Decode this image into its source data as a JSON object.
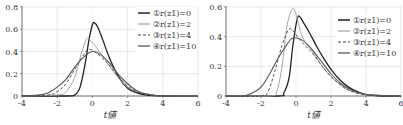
{
  "chart_data": [
    {
      "type": "line",
      "title": "",
      "xlabel": "t値",
      "ylabel": "",
      "xlim": [
        -4,
        6
      ],
      "ylim": [
        0,
        0.8
      ],
      "xticks": [
        "-4",
        "-2",
        "0",
        "2",
        "4",
        "6"
      ],
      "yticks": [
        "0",
        "0.2",
        "0.4",
        "0.6",
        "0.8"
      ],
      "grid": true,
      "legend_position": "upper right",
      "series": [
        {
          "name": "①r(z1)=0",
          "style": "solid-dark",
          "x": [
            -4,
            -1.5,
            -1,
            -0.7,
            -0.4,
            -0.2,
            0,
            0.1,
            0.3,
            0.6,
            1,
            1.5,
            2,
            2.5,
            3,
            4,
            6
          ],
          "values": [
            0,
            0,
            0.01,
            0.08,
            0.3,
            0.5,
            0.64,
            0.66,
            0.62,
            0.5,
            0.33,
            0.17,
            0.07,
            0.03,
            0.01,
            0,
            0
          ]
        },
        {
          "name": "②r(z1)=2",
          "style": "solid-light",
          "x": [
            -4,
            -2,
            -1.5,
            -1,
            -0.6,
            -0.3,
            -0.1,
            0.3,
            0.7,
            1,
            1.5,
            2,
            2.5,
            3,
            4,
            6
          ],
          "values": [
            0,
            0.01,
            0.04,
            0.17,
            0.4,
            0.52,
            0.5,
            0.42,
            0.33,
            0.26,
            0.16,
            0.08,
            0.04,
            0.02,
            0,
            0
          ]
        },
        {
          "name": "③r(z1)=4",
          "style": "dashed",
          "x": [
            -4,
            -2.5,
            -2,
            -1.5,
            -1,
            -0.5,
            -0.2,
            0.2,
            0.7,
            1,
            1.5,
            2,
            2.5,
            3,
            4,
            6
          ],
          "values": [
            0,
            0.01,
            0.04,
            0.11,
            0.24,
            0.37,
            0.42,
            0.39,
            0.32,
            0.27,
            0.17,
            0.09,
            0.04,
            0.02,
            0,
            0
          ]
        },
        {
          "name": "④r(z1)=10",
          "style": "solid-gray",
          "x": [
            -4,
            -3,
            -2.5,
            -2,
            -1.5,
            -1,
            -0.5,
            0,
            0.5,
            1,
            1.5,
            2,
            2.5,
            3,
            4,
            6
          ],
          "values": [
            0,
            0.01,
            0.03,
            0.08,
            0.15,
            0.26,
            0.35,
            0.4,
            0.37,
            0.29,
            0.19,
            0.11,
            0.05,
            0.02,
            0,
            0
          ]
        }
      ]
    },
    {
      "type": "line",
      "title": "",
      "xlabel": "t値",
      "ylabel": "",
      "xlim": [
        -4,
        6
      ],
      "ylim": [
        0,
        0.6
      ],
      "xticks": [
        "-4",
        "-2",
        "0",
        "2",
        "4",
        "6"
      ],
      "yticks": [
        "0",
        "0.2",
        "0.4",
        "0.6"
      ],
      "grid": true,
      "legend_position": "upper right",
      "series": [
        {
          "name": "①r(z1)=0",
          "style": "solid-dark",
          "x": [
            -4,
            -1,
            -0.7,
            -0.4,
            -0.2,
            0,
            0.15,
            0.4,
            0.8,
            1.2,
            1.6,
            2,
            2.5,
            3,
            3.5,
            4,
            5,
            6
          ],
          "values": [
            0,
            0,
            0.02,
            0.12,
            0.32,
            0.48,
            0.54,
            0.5,
            0.42,
            0.33,
            0.25,
            0.18,
            0.11,
            0.06,
            0.03,
            0.01,
            0,
            0
          ]
        },
        {
          "name": "②r(z1)=2",
          "style": "solid-light",
          "x": [
            -4,
            -1.5,
            -1.1,
            -0.8,
            -0.5,
            -0.2,
            0,
            0.3,
            0.6,
            1,
            1.5,
            2,
            2.5,
            3,
            4,
            6
          ],
          "values": [
            0,
            0,
            0.03,
            0.2,
            0.48,
            0.59,
            0.55,
            0.42,
            0.35,
            0.29,
            0.2,
            0.13,
            0.08,
            0.04,
            0.01,
            0
          ]
        },
        {
          "name": "③r(z1)=4",
          "style": "dashed",
          "x": [
            -4,
            -2,
            -1.6,
            -1.2,
            -0.8,
            -0.4,
            -0.1,
            0.2,
            0.6,
            1,
            1.5,
            2,
            2.5,
            3,
            4,
            6
          ],
          "values": [
            0,
            0,
            0.03,
            0.17,
            0.34,
            0.45,
            0.43,
            0.38,
            0.33,
            0.28,
            0.2,
            0.13,
            0.08,
            0.04,
            0.01,
            0
          ]
        },
        {
          "name": "④r(z1)=10",
          "style": "solid-gray",
          "x": [
            -4,
            -3,
            -2.5,
            -2,
            -1.5,
            -1,
            -0.5,
            -0.2,
            0.3,
            0.8,
            1.2,
            1.6,
            2,
            2.5,
            3,
            4,
            6
          ],
          "values": [
            0,
            0,
            0.02,
            0.06,
            0.15,
            0.26,
            0.35,
            0.39,
            0.38,
            0.33,
            0.27,
            0.21,
            0.15,
            0.09,
            0.05,
            0.01,
            0
          ]
        }
      ]
    }
  ],
  "styles": {
    "solid-dark": {
      "color": "#222222",
      "width": 1.3,
      "dash": ""
    },
    "solid-light": {
      "color": "#9a9a9a",
      "width": 0.9,
      "dash": ""
    },
    "dashed": {
      "color": "#444444",
      "width": 0.9,
      "dash": "3,2"
    },
    "solid-gray": {
      "color": "#555555",
      "width": 1.1,
      "dash": ""
    }
  },
  "layout": [
    {
      "left": 22,
      "right": 198,
      "top": 7,
      "bottom": 96,
      "legend_x": 138,
      "legend_y": 8
    },
    {
      "left": 226,
      "right": 401,
      "top": 7,
      "bottom": 96,
      "legend_x": 338,
      "legend_y": 15
    }
  ]
}
